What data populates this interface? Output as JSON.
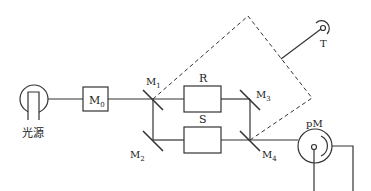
{
  "diagram": {
    "type": "optical-path-schematic",
    "components": {
      "light_source": {
        "label": "光源"
      },
      "m0": {
        "label": "M",
        "sub": "0"
      },
      "m1": {
        "label": "M",
        "sub": "1"
      },
      "m2": {
        "label": "M",
        "sub": "2"
      },
      "m3": {
        "label": "M",
        "sub": "3"
      },
      "m4": {
        "label": "M",
        "sub": "4"
      },
      "reference_cell": {
        "label": "R"
      },
      "sample_cell": {
        "label": "S"
      },
      "rotor": {
        "label": "T"
      },
      "photomultiplier": {
        "label": "pM"
      }
    },
    "colors": {
      "line": "#333333",
      "background": "#ffffff"
    }
  }
}
